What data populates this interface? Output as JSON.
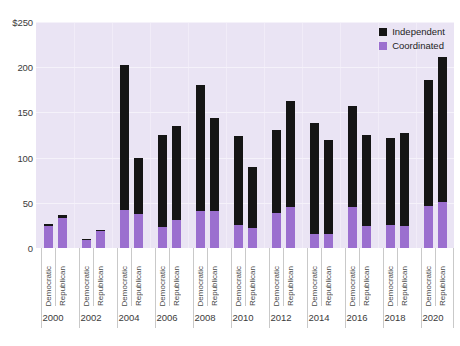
{
  "chart_data": {
    "type": "bar",
    "title": "",
    "subtitle": "",
    "xlabel": "",
    "ylabel": "",
    "stacked": true,
    "grid": true,
    "legend_position": "top-right-inside",
    "ylim": [
      0,
      250
    ],
    "yticks": [
      0,
      50,
      100,
      150,
      200,
      250
    ],
    "ytick_labels": [
      "0",
      "50",
      "100",
      "150",
      "200",
      "$250"
    ],
    "group_labels": [
      "2000",
      "2002",
      "2004",
      "2006",
      "2008",
      "2010",
      "2012",
      "2014",
      "2016",
      "2018",
      "2020"
    ],
    "categories": [
      "Democratic",
      "Republican",
      "Democratic",
      "Republican",
      "Democratic",
      "Republican",
      "Democratic",
      "Republican",
      "Democratic",
      "Republican",
      "Democratic",
      "Republican",
      "Democratic",
      "Republican",
      "Democratic",
      "Republican",
      "Democratic",
      "Republican",
      "Democratic",
      "Republican",
      "Democratic",
      "Republican"
    ],
    "series": [
      {
        "name": "Coordinated",
        "color": "#9b6fcf",
        "values": [
          24,
          33,
          9,
          19,
          42,
          38,
          23,
          31,
          41,
          41,
          26,
          22,
          39,
          45,
          15,
          15,
          45,
          24,
          25,
          24,
          46,
          51
        ]
      },
      {
        "name": "Independent",
        "color": "#151515",
        "values": [
          3,
          3,
          1,
          1,
          160,
          62,
          102,
          104,
          139,
          103,
          98,
          68,
          92,
          118,
          123,
          104,
          112,
          101,
          97,
          103,
          140,
          160
        ]
      }
    ],
    "totals": [
      27,
      36,
      10,
      20,
      202,
      100,
      125,
      135,
      180,
      144,
      124,
      90,
      131,
      163,
      138,
      119,
      157,
      125,
      122,
      127,
      186,
      211
    ],
    "legend": [
      {
        "label": "Independent",
        "color": "#151515"
      },
      {
        "label": "Coordinated",
        "color": "#9b6fcf"
      }
    ],
    "colors": {
      "plot_background": "#eae4f4",
      "page_background": "#ffffff",
      "gridline": "#f5f2fa",
      "independent": "#151515",
      "coordinated": "#9b6fcf",
      "tick_text": "#3b3b3b"
    }
  }
}
